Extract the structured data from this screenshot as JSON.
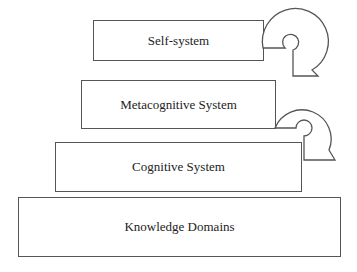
{
  "diagram": {
    "levels": [
      {
        "id": "self",
        "label": "Self-system"
      },
      {
        "id": "meta",
        "label": "Metacognitive System"
      },
      {
        "id": "cog",
        "label": "Cognitive System"
      },
      {
        "id": "know",
        "label": "Knowledge Domains"
      }
    ],
    "connectors": [
      {
        "from": "self",
        "to": "meta",
        "shape": "curled-arrow"
      },
      {
        "from": "meta",
        "to": "cog",
        "shape": "curled-arrow"
      }
    ],
    "colors": {
      "stroke": "#555555",
      "text": "#222222",
      "background": "#ffffff"
    }
  }
}
